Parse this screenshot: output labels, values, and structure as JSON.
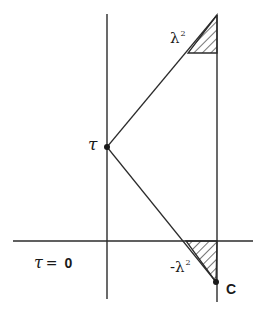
{
  "diagram": {
    "stroke_color": "#2b2b2b",
    "labels": {
      "tau_point": "τ",
      "lambda_sq_top": "λ",
      "lambda_sq_top_exp": "2",
      "lambda_sq_bottom_sign": "-",
      "lambda_sq_bottom": "λ",
      "lambda_sq_bottom_exp": "2",
      "point_c": "C",
      "baseline_tau": "τ",
      "baseline_equals": "=",
      "baseline_zero": "0"
    },
    "geometry": {
      "left_vertical": {
        "x": 107,
        "y1": 14,
        "y2": 299
      },
      "right_vertical": {
        "x": 217,
        "y1": 15,
        "y2": 302
      },
      "horizontal_axis": {
        "y": 241,
        "x1": 13,
        "x2": 253
      },
      "point_tau": {
        "x": 107,
        "y": 147
      },
      "point_c": {
        "x": 216,
        "y": 282
      },
      "upper_triangle": [
        [
          217,
          15
        ],
        [
          188,
          53
        ],
        [
          217,
          53
        ]
      ],
      "lower_triangle": [
        [
          186,
          241
        ],
        [
          217,
          241
        ],
        [
          216,
          282
        ]
      ]
    }
  }
}
